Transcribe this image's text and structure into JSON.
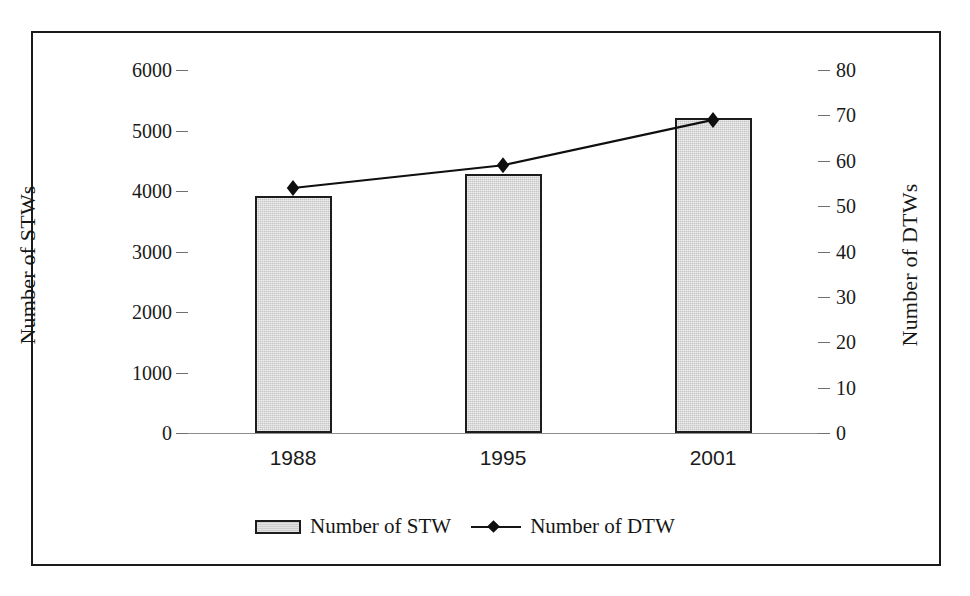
{
  "chart_data": {
    "type": "bar",
    "title": "",
    "subtitle": "",
    "xlabel": "",
    "categories": [
      "1988",
      "1995",
      "2001"
    ],
    "grid": false,
    "legend_position": "bottom",
    "axes": {
      "left": {
        "label": "Number of STWs",
        "ticks": [
          "0",
          "1000",
          "2000",
          "3000",
          "4000",
          "5000",
          "6000"
        ],
        "tick_values": [
          0,
          1000,
          2000,
          3000,
          4000,
          5000,
          6000
        ],
        "range": [
          0,
          6000
        ]
      },
      "right": {
        "label": "Number of DTWs",
        "ticks": [
          "0",
          "10",
          "20",
          "30",
          "40",
          "50",
          "60",
          "70",
          "80"
        ],
        "tick_values": [
          0,
          10,
          20,
          30,
          40,
          50,
          60,
          70,
          80
        ],
        "range": [
          0,
          80
        ]
      }
    },
    "series": [
      {
        "name": "Number of STW",
        "render": "bar",
        "axis": "left",
        "values": [
          3920,
          4280,
          5200
        ],
        "color": "#d2d2d2",
        "edge_color": "#1c1c1c"
      },
      {
        "name": "Number of DTW",
        "render": "line",
        "axis": "right",
        "values": [
          54,
          59,
          69
        ],
        "color": "#0f0f0f",
        "marker": "diamond"
      }
    ]
  },
  "legend": {
    "items": [
      {
        "label": "Number of STW",
        "swatch": "bar-swatch"
      },
      {
        "label": "Number of DTW",
        "swatch": "line-diamond-swatch"
      }
    ]
  },
  "colors": {
    "frame": "#1b1b1b",
    "bar_fill": "#d2d2d2",
    "bar_edge": "#1c1c1c",
    "line": "#0f0f0f",
    "text": "#1a1a1a",
    "tick": "#6f6f6f",
    "background": "#ffffff"
  }
}
